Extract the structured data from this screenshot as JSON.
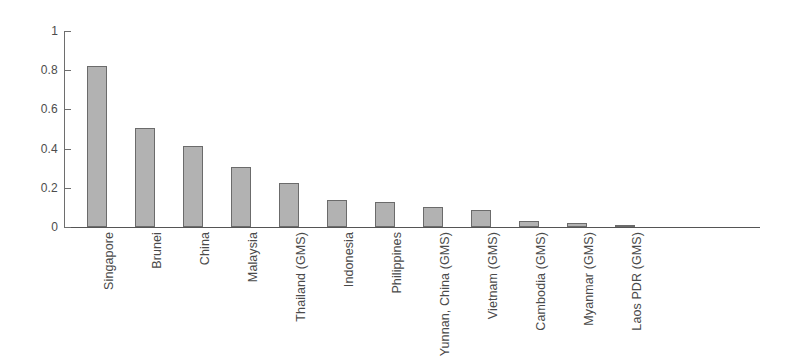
{
  "chart_data": {
    "type": "bar",
    "title": "",
    "subtitle": "",
    "xlabel": "",
    "ylabel": "",
    "ylim": [
      0,
      1
    ],
    "grid": false,
    "legend": "none",
    "orientation": "vertical",
    "bar_fill_color": "#b2b2b2",
    "bar_border_color": "#6b6b6b",
    "axis_color": "#6e6e6e",
    "background_color": "#ffffff",
    "ytick_labels": [
      "0",
      "0.2",
      "0.4",
      "0.6",
      "0.8",
      "1"
    ],
    "ytick_values": [
      0,
      0.2,
      0.4,
      0.6,
      0.8,
      1
    ],
    "categories": [
      "Singapore",
      "Brunei",
      "China",
      "Malaysia",
      "Thailand (GMS)",
      "Indonesia",
      "Philippines",
      "Yunnan, China (GMS)",
      "Vietnam (GMS)",
      "Cambodia (GMS)",
      "Myanmar (GMS)",
      "Laos PDR (GMS)"
    ],
    "values": [
      0.82,
      0.505,
      0.415,
      0.305,
      0.225,
      0.14,
      0.13,
      0.1,
      0.085,
      0.03,
      0.02,
      0.005
    ]
  }
}
